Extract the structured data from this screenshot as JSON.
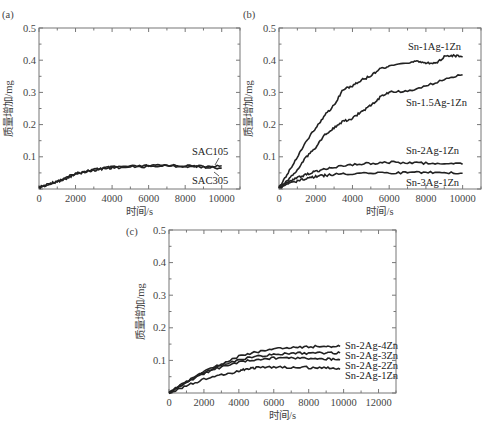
{
  "chart_data": [
    {
      "id": "a",
      "type": "line",
      "panel_label": "(a)",
      "xlabel": "时间/s",
      "ylabel": "质量增加/mg",
      "xlim": [
        0,
        11000
      ],
      "ylim": [
        0,
        0.5
      ],
      "xticks": [
        0,
        2000,
        4000,
        6000,
        8000,
        10000
      ],
      "yticks": [
        0.1,
        0.2,
        0.3,
        0.4,
        0.5
      ],
      "ytick_labels": [
        "0.1",
        "0.2",
        "0.3",
        "0.4",
        "0.5"
      ],
      "grid": false,
      "series": [
        {
          "name": "SAC105",
          "x": [
            0,
            500,
            1000,
            1500,
            2000,
            2500,
            3000,
            3500,
            4000,
            5000,
            6000,
            7000,
            8000,
            9000,
            10000
          ],
          "y": [
            0.005,
            0.015,
            0.025,
            0.035,
            0.048,
            0.055,
            0.06,
            0.065,
            0.068,
            0.07,
            0.072,
            0.074,
            0.072,
            0.07,
            0.072
          ]
        },
        {
          "name": "SAC305",
          "x": [
            0,
            500,
            1000,
            1500,
            2000,
            2500,
            3000,
            3500,
            4000,
            5000,
            6000,
            7000,
            8000,
            9000,
            10000
          ],
          "y": [
            0.004,
            0.013,
            0.023,
            0.033,
            0.046,
            0.053,
            0.058,
            0.063,
            0.066,
            0.068,
            0.07,
            0.072,
            0.07,
            0.068,
            0.065
          ]
        }
      ]
    },
    {
      "id": "b",
      "type": "line",
      "panel_label": "(b)",
      "xlabel": "时间/s",
      "ylabel": "质量增加/mg",
      "xlim": [
        0,
        11000
      ],
      "ylim": [
        0,
        0.5
      ],
      "xticks": [
        0,
        2000,
        4000,
        6000,
        8000,
        10000
      ],
      "yticks": [
        0.1,
        0.2,
        0.3,
        0.4,
        0.5
      ],
      "ytick_labels": [
        "0.1",
        "0.2",
        "0.3",
        "0.4",
        "0.5"
      ],
      "grid": false,
      "series": [
        {
          "name": "Sn-1Ag-1Zn",
          "x": [
            0,
            500,
            1000,
            1500,
            2000,
            2500,
            3000,
            3500,
            4000,
            4500,
            5000,
            5500,
            6000,
            7000,
            7500,
            8000,
            8500,
            9000,
            9500,
            10000
          ],
          "y": [
            0.005,
            0.05,
            0.1,
            0.15,
            0.19,
            0.23,
            0.26,
            0.31,
            0.32,
            0.34,
            0.35,
            0.375,
            0.38,
            0.39,
            0.4,
            0.39,
            0.39,
            0.41,
            0.415,
            0.41
          ]
        },
        {
          "name": "Sn-1.5Ag-1Zn",
          "x": [
            0,
            500,
            1000,
            1500,
            2000,
            2500,
            3000,
            3500,
            4000,
            4500,
            5000,
            5500,
            6000,
            7000,
            8000,
            9000,
            10000
          ],
          "y": [
            0.005,
            0.03,
            0.06,
            0.1,
            0.13,
            0.17,
            0.19,
            0.21,
            0.22,
            0.24,
            0.26,
            0.285,
            0.3,
            0.305,
            0.32,
            0.34,
            0.355
          ]
        },
        {
          "name": "Sn-2Ag-1Zn",
          "x": [
            0,
            500,
            1000,
            1500,
            2000,
            2500,
            3000,
            4000,
            5000,
            6000,
            7000,
            8000,
            9000,
            10000
          ],
          "y": [
            0.005,
            0.02,
            0.035,
            0.045,
            0.055,
            0.062,
            0.068,
            0.076,
            0.08,
            0.083,
            0.082,
            0.08,
            0.08,
            0.077
          ]
        },
        {
          "name": "Sn-3Ag-1Zn",
          "x": [
            0,
            500,
            1000,
            1500,
            2000,
            2500,
            3000,
            4000,
            5000,
            6000,
            7000,
            8000,
            9000,
            10000
          ],
          "y": [
            0.004,
            0.015,
            0.025,
            0.032,
            0.038,
            0.042,
            0.045,
            0.048,
            0.05,
            0.051,
            0.05,
            0.052,
            0.05,
            0.049
          ]
        }
      ]
    },
    {
      "id": "c",
      "type": "line",
      "panel_label": "(c)",
      "xlabel": "时间/s",
      "ylabel": "质量增加/mg",
      "xlim": [
        0,
        13000
      ],
      "ylim": [
        0,
        0.5
      ],
      "xticks": [
        0,
        2000,
        4000,
        6000,
        8000,
        10000,
        12000
      ],
      "yticks": [
        0.1,
        0.2,
        0.3,
        0.4,
        0.5
      ],
      "ytick_labels": [
        "0.1",
        "0.2",
        "0.3",
        "0.4",
        "0.5"
      ],
      "grid": false,
      "series": [
        {
          "name": "Sn-2Ag-4Zn",
          "x": [
            0,
            1000,
            2000,
            3000,
            4000,
            5000,
            6000,
            7000,
            8000,
            9000,
            9800
          ],
          "y": [
            0.0,
            0.035,
            0.065,
            0.09,
            0.112,
            0.125,
            0.135,
            0.14,
            0.142,
            0.143,
            0.143
          ]
        },
        {
          "name": "Sn-2Ag-3Zn",
          "x": [
            0,
            1000,
            2000,
            3000,
            4000,
            5000,
            6000,
            7000,
            8000,
            9000,
            9800
          ],
          "y": [
            0.0,
            0.033,
            0.063,
            0.085,
            0.102,
            0.112,
            0.118,
            0.122,
            0.122,
            0.123,
            0.123
          ]
        },
        {
          "name": "Sn-2Ag-2Zn",
          "x": [
            0,
            1000,
            2000,
            3000,
            4000,
            5000,
            6000,
            7000,
            8000,
            9000,
            9800
          ],
          "y": [
            0.0,
            0.032,
            0.06,
            0.08,
            0.095,
            0.103,
            0.107,
            0.108,
            0.106,
            0.104,
            0.102
          ]
        },
        {
          "name": "Sn-2Ag-1Zn",
          "x": [
            0,
            1000,
            2000,
            3000,
            4000,
            4500,
            5000,
            6000,
            7000,
            8000,
            9000,
            9800
          ],
          "y": [
            0.0,
            0.022,
            0.042,
            0.056,
            0.066,
            0.075,
            0.077,
            0.079,
            0.079,
            0.078,
            0.077,
            0.073
          ]
        }
      ]
    }
  ]
}
